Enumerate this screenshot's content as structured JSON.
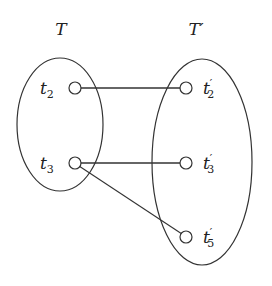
{
  "sets": [
    {
      "id": "T",
      "label": "T",
      "prime": ""
    },
    {
      "id": "Tp",
      "label": "T",
      "prime": "′"
    }
  ],
  "nodes": [
    {
      "id": "t2",
      "base": "t",
      "prime": "",
      "sub": "2",
      "set": "T"
    },
    {
      "id": "t3",
      "base": "t",
      "prime": "",
      "sub": "3",
      "set": "T"
    },
    {
      "id": "t2p",
      "base": "t",
      "prime": "′",
      "sub": "2",
      "set": "T′"
    },
    {
      "id": "t3p",
      "base": "t",
      "prime": "′",
      "sub": "3",
      "set": "T′"
    },
    {
      "id": "t5p",
      "base": "t",
      "prime": "′",
      "sub": "5",
      "set": "T′"
    }
  ],
  "edges": [
    {
      "from": "t2",
      "to": "t2p"
    },
    {
      "from": "t3",
      "to": "t3p"
    },
    {
      "from": "t3",
      "to": "t5p"
    }
  ]
}
